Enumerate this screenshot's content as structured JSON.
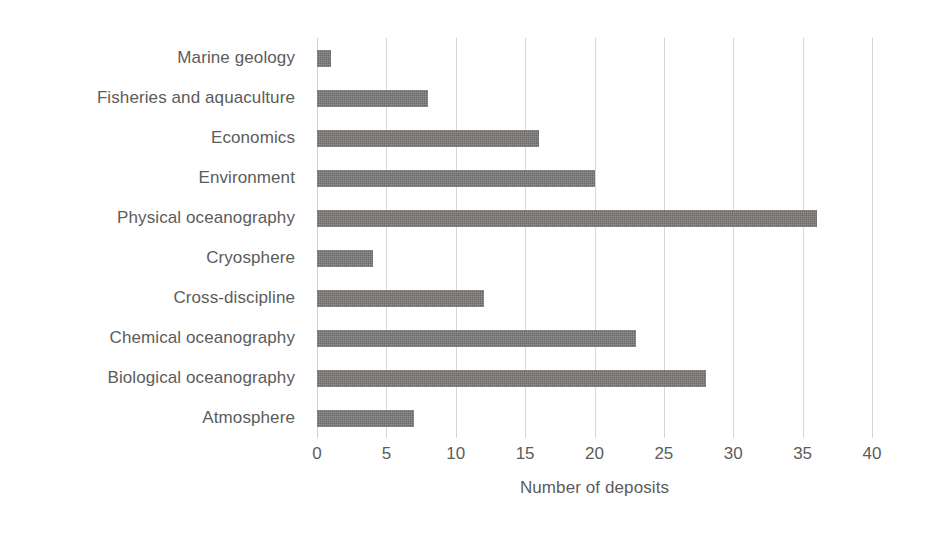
{
  "chart_data": {
    "type": "bar",
    "orientation": "horizontal",
    "title": "",
    "subtitle": "",
    "xlabel": "Number of deposits",
    "ylabel": "",
    "categories": [
      "Marine geology",
      "Fisheries and aquaculture",
      "Economics",
      "Environment",
      "Physical oceanography",
      "Cryosphere",
      "Cross-discipline",
      "Chemical oceanography",
      "Biological oceanography",
      "Atmosphere"
    ],
    "values": [
      1,
      8,
      16,
      20,
      36,
      4,
      12,
      23,
      28,
      7
    ],
    "xlim": [
      0,
      40
    ],
    "xticks": [
      0,
      5,
      10,
      15,
      20,
      25,
      30,
      35,
      40
    ],
    "xtick_labels": [
      "0",
      "5",
      "10",
      "15",
      "20",
      "25",
      "30",
      "35",
      "40"
    ],
    "grid": "vertical",
    "legend": "none",
    "bar_color": "#787575",
    "gridline_color": "#d7d7d7",
    "text_color": "#5c5c5c",
    "background_color": "#ffffff"
  }
}
